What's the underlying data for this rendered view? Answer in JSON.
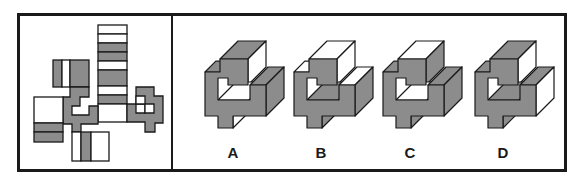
{
  "puzzle": {
    "type": "cube-net-folding",
    "net": {
      "description": "unfolded net of a 3D block with striped column and stepped gray faces"
    },
    "options": [
      {
        "label": "A",
        "offset_x": 0,
        "faces": {
          "bar_top": "#8c8c8c",
          "bar_side": "#ffffff",
          "left_top": "#8c8c8c",
          "floor": "#ffffff",
          "pillar_top": "#8c8c8c",
          "pillar_side": "#8c8c8c",
          "tab_side": "#ffffff"
        }
      },
      {
        "label": "B",
        "offset_x": 89,
        "faces": {
          "bar_top": "#ffffff",
          "bar_side": "#ffffff",
          "left_top": "#ffffff",
          "floor": "#8c8c8c",
          "pillar_top": "#ffffff",
          "pillar_side": "#8c8c8c",
          "tab_side": "#8c8c8c"
        }
      },
      {
        "label": "C",
        "offset_x": 178,
        "faces": {
          "bar_top": "#ffffff",
          "bar_side": "#8c8c8c",
          "left_top": "#8c8c8c",
          "floor": "#ffffff",
          "pillar_top": "#8c8c8c",
          "pillar_side": "#8c8c8c",
          "tab_side": "#8c8c8c"
        }
      },
      {
        "label": "D",
        "offset_x": 270,
        "faces": {
          "bar_top": "#8c8c8c",
          "bar_side": "#ffffff",
          "left_top": "#8c8c8c",
          "floor": "#8c8c8c",
          "pillar_top": "#8c8c8c",
          "pillar_side": "#ffffff",
          "tab_side": "#8c8c8c"
        }
      }
    ]
  },
  "colors": {
    "gray": "#8c8c8c",
    "white": "#ffffff",
    "line": "#1a1a1a"
  }
}
